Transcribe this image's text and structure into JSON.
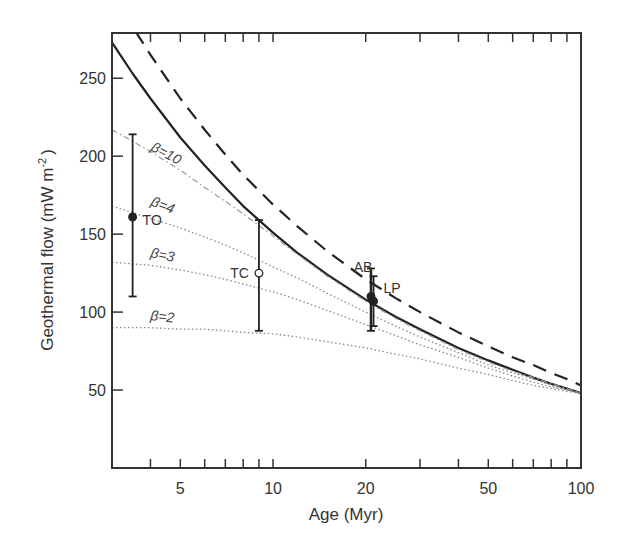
{
  "chart_data": {
    "type": "line",
    "title": "",
    "xlabel": "Age (Myr)",
    "ylabel": "Geothermal flow (mW m⁻²)",
    "ylabel_main": "Geothermal flow (mW m",
    "ylabel_sup": "-2",
    "ylabel_end": ")",
    "xscale": "log",
    "xlim": [
      3.0,
      100
    ],
    "ylim": [
      0,
      279
    ],
    "grid": false,
    "xticks_major": [
      5,
      10,
      20,
      50,
      100
    ],
    "xticks_minor": [
      4,
      5,
      6,
      7,
      8,
      9,
      10,
      20,
      30,
      40,
      50,
      60,
      70,
      80,
      90
    ],
    "yticks": [
      50,
      100,
      150,
      200,
      250
    ],
    "series": [
      {
        "name": "reference (dashed)",
        "style": "dashed",
        "x": [
          3.0,
          3.5,
          4,
          5,
          6,
          7,
          8,
          10,
          12,
          15,
          20,
          25,
          30,
          40,
          50,
          60,
          70,
          80,
          90,
          100
        ],
        "values": [
          305,
          283,
          265,
          237,
          217,
          201,
          188,
          169,
          155,
          139,
          121,
          109,
          100,
          87,
          78,
          71,
          66,
          61,
          57,
          53
        ]
      },
      {
        "name": "reference (solid)",
        "style": "solid",
        "x": [
          3.0,
          3.5,
          4,
          5,
          6,
          7,
          8,
          10,
          12,
          15,
          20,
          25,
          30,
          40,
          50,
          60,
          70,
          80,
          90,
          100
        ],
        "values": [
          273,
          253,
          237,
          212,
          194,
          180,
          168,
          151,
          138,
          124,
          108,
          97,
          89,
          77,
          69,
          63,
          58,
          54,
          51,
          48
        ]
      },
      {
        "name": "β=10",
        "style": "dash-dot",
        "label": "β=10",
        "x": [
          3.0,
          4,
          5,
          6,
          7,
          8,
          10,
          12,
          15,
          20,
          25,
          30,
          40,
          50,
          60,
          70,
          80,
          90,
          100
        ],
        "values": [
          217,
          203,
          191,
          180,
          171,
          163,
          149,
          137,
          123,
          107,
          96,
          88,
          76,
          68,
          62,
          58,
          54,
          51,
          48
        ]
      },
      {
        "name": "β=4",
        "style": "dotted",
        "label": "β=4",
        "x": [
          3.0,
          4,
          5,
          6,
          7,
          8,
          10,
          12,
          15,
          20,
          25,
          30,
          40,
          50,
          60,
          70,
          80,
          90,
          100
        ],
        "values": [
          168,
          160,
          154,
          148,
          143,
          138,
          129,
          122,
          112,
          100,
          91,
          84,
          74,
          66,
          61,
          57,
          53,
          50,
          48
        ]
      },
      {
        "name": "β=3",
        "style": "dotted",
        "label": "β=3",
        "x": [
          3.0,
          4,
          5,
          6,
          7,
          8,
          10,
          12,
          15,
          20,
          25,
          30,
          40,
          50,
          60,
          70,
          80,
          90,
          100
        ],
        "values": [
          132,
          130,
          127,
          124,
          121,
          118,
          113,
          108,
          101,
          92,
          85,
          79,
          71,
          64,
          59,
          55,
          52,
          50,
          48
        ]
      },
      {
        "name": "β=2",
        "style": "dotted",
        "label": "β=2",
        "x": [
          3.0,
          4,
          5,
          6,
          7,
          8,
          10,
          12,
          15,
          20,
          25,
          30,
          40,
          50,
          60,
          70,
          80,
          90,
          100
        ],
        "values": [
          90,
          90,
          89,
          89,
          88,
          87,
          86,
          84,
          81,
          77,
          73,
          70,
          64,
          60,
          56,
          53,
          51,
          49,
          48
        ]
      }
    ],
    "points": [
      {
        "label": "TO",
        "age": 3.5,
        "value": 161,
        "err_low": 110,
        "err_high": 214,
        "marker": "filled"
      },
      {
        "label": "TC",
        "age": 9.0,
        "value": 125,
        "err_low": 88,
        "err_high": 159,
        "marker": "open"
      },
      {
        "label": "AB",
        "age": 20.8,
        "value": 110,
        "err_low": 88,
        "err_high": 128,
        "marker": "filled"
      },
      {
        "label": "LP",
        "age": 21.2,
        "value": 107,
        "err_low": 91,
        "err_high": 123,
        "marker": "filled"
      }
    ],
    "annotations": [
      "β=10",
      "β=4",
      "β=3",
      "β=2",
      "TO",
      "TC",
      "AB",
      "LP"
    ]
  }
}
